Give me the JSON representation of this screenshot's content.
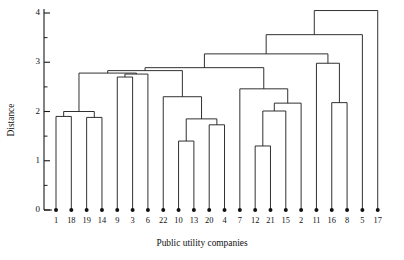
{
  "chart_data": {
    "type": "dendrogram",
    "title": "",
    "xlabel": "Public utility companies",
    "ylabel": "Distance",
    "ylim": [
      0,
      4.15
    ],
    "y_ticks_major": [
      0,
      1,
      2,
      3,
      4
    ],
    "y_ticks_major_labels": [
      "0",
      "1",
      "2",
      "3",
      "4"
    ],
    "y_ticks_minor": [
      0.5,
      1.5,
      2.5,
      3.5
    ],
    "grid": false,
    "legend": "none",
    "leaf_order": [
      "1",
      "18",
      "19",
      "14",
      "9",
      "3",
      "6",
      "22",
      "10",
      "13",
      "20",
      "4",
      "7",
      "12",
      "21",
      "15",
      "2",
      "11",
      "16",
      "8",
      "5",
      "17"
    ],
    "n_leaves": 22,
    "merges": [
      {
        "id": "m1",
        "left": "1",
        "right": "18",
        "height": 1.9
      },
      {
        "id": "m2",
        "left": "19",
        "right": "14",
        "height": 1.88
      },
      {
        "id": "m3",
        "left": "m1",
        "right": "m2",
        "height": 2.0
      },
      {
        "id": "m4",
        "left": "9",
        "right": "3",
        "height": 2.7
      },
      {
        "id": "m5",
        "left": "m4",
        "right": "6",
        "height": 2.76
      },
      {
        "id": "m6",
        "left": "m3",
        "right": "m5",
        "height": 2.78
      },
      {
        "id": "m7",
        "left": "10",
        "right": "13",
        "height": 1.4
      },
      {
        "id": "m8",
        "left": "20",
        "right": "4",
        "height": 1.73
      },
      {
        "id": "m9",
        "left": "m7",
        "right": "m8",
        "height": 1.85
      },
      {
        "id": "m10",
        "left": "22",
        "right": "m9",
        "height": 2.3
      },
      {
        "id": "m11",
        "left": "m6",
        "right": "m10",
        "height": 2.83
      },
      {
        "id": "m12",
        "left": "12",
        "right": "21",
        "height": 1.3
      },
      {
        "id": "m13",
        "left": "m12",
        "right": "15",
        "height": 2.01
      },
      {
        "id": "m14",
        "left": "m13",
        "right": "2",
        "height": 2.17
      },
      {
        "id": "m15",
        "left": "7",
        "right": "m14",
        "height": 2.46
      },
      {
        "id": "m16",
        "left": "m11",
        "right": "m15",
        "height": 2.89
      },
      {
        "id": "m17",
        "left": "16",
        "right": "8",
        "height": 2.18
      },
      {
        "id": "m18",
        "left": "11",
        "right": "m17",
        "height": 2.98
      },
      {
        "id": "m19",
        "left": "m16",
        "right": "m18",
        "height": 3.17
      },
      {
        "id": "m20",
        "left": "m19",
        "right": "5",
        "height": 3.56
      },
      {
        "id": "m21",
        "left": "m20",
        "right": "17",
        "height": 4.05
      }
    ]
  },
  "axis": {
    "y_title": "Distance",
    "x_title": "Public utility companies"
  }
}
